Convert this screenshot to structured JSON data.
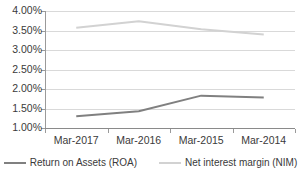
{
  "chart_data": {
    "type": "line",
    "title": "",
    "xlabel": "",
    "ylabel": "",
    "categories": [
      "Mar-2017",
      "Mar-2016",
      "Mar-2015",
      "Mar-2014"
    ],
    "series": [
      {
        "name": "Return on Assets (ROA)",
        "color": "#808080",
        "values": [
          1.3,
          1.43,
          1.83,
          1.78
        ]
      },
      {
        "name": "Net interest margin (NIM)",
        "color": "#d2d2d2",
        "values": [
          3.57,
          3.74,
          3.53,
          3.4
        ]
      }
    ],
    "ylim": [
      1.0,
      4.0
    ],
    "ytick_values": [
      4.0,
      3.5,
      3.0,
      2.5,
      2.0,
      1.5,
      1.0
    ],
    "ytick_labels": [
      "4.00%",
      "3.50%",
      "3.00%",
      "2.50%",
      "2.00%",
      "1.50%",
      "1.00%"
    ],
    "grid": true,
    "legend_position": "bottom"
  }
}
